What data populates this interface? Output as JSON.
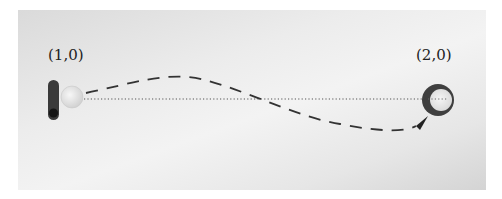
{
  "diagram": {
    "start_label": "(1,0)",
    "end_label": "(2,0)",
    "objects": [
      {
        "name": "paddle",
        "shape": "rounded-bar",
        "color": "#3a3a3a"
      },
      {
        "name": "ball",
        "shape": "circle",
        "color": "#e4e4e4"
      },
      {
        "name": "target-ring",
        "shape": "ring",
        "color": "#444444"
      }
    ],
    "lines": [
      {
        "name": "direct-path",
        "style": "dotted",
        "from": "(1,0)",
        "to": "(2,0)"
      },
      {
        "name": "curved-trajectory",
        "style": "dashed",
        "arrow": "end"
      }
    ],
    "colors": {
      "background": "#ececec",
      "ink": "#333333"
    }
  }
}
